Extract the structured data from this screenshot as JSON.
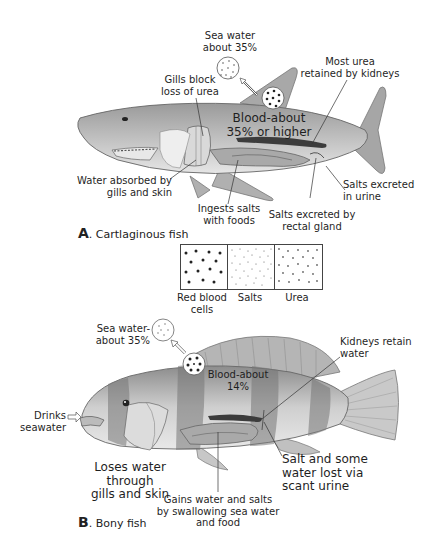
{
  "panel_a": {
    "caption_letter": "A",
    "caption_text": ". Cartlaginous fish",
    "labels": {
      "sea_water": "Sea water\nabout 35%",
      "gills_block": "Gills block\nloss of urea",
      "blood": "Blood-about\n35% or higher",
      "most_urea": "Most urea\nretained by kidneys",
      "water_absorbed": "Water absorbed by\ngills and skin",
      "ingests_salts": "Ingests salts\nwith foods",
      "salts_urine": "Salts excreted\nin urine",
      "salts_rectal": "Salts excreted by\nrectal gland"
    }
  },
  "legend": {
    "items": [
      {
        "label": "Red blood\ncells",
        "symbol": "large-dark-dots"
      },
      {
        "label": "Salts",
        "symbol": "tiny-dots"
      },
      {
        "label": "Urea",
        "symbol": "small-gray-dots"
      }
    ]
  },
  "panel_b": {
    "caption_letter": "B",
    "caption_text": ". Bony fish",
    "labels": {
      "sea_water": "Sea water-\nabout 35%",
      "kidneys": "Kidneys retain\nwater",
      "blood": "Blood-about\n14%",
      "drinks": "Drinks\nseawater",
      "loses_water": "Loses water through\ngills and skin",
      "gains_water": "Gains water and salts\nby swallowing sea water\nand food",
      "salt_lost": "Salt and some\nwater lost via\nscant urine"
    }
  },
  "colors": {
    "body_fill": "#b9b9b9",
    "body_dark": "#8a8a8a",
    "organ": "#a3a3a3",
    "kidney": "#444444",
    "stripe": "#6e6e6e",
    "line": "#333333"
  }
}
